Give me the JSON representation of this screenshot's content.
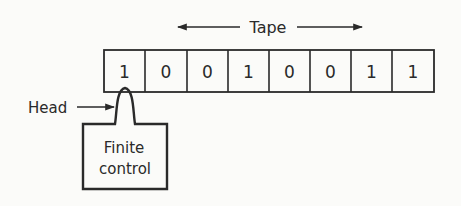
{
  "diagram": {
    "background": "#fbfbf9",
    "line_color": "#2a2a2a",
    "tape": {
      "label": "Tape",
      "direction": "bidirectional",
      "cells": [
        "1",
        "0",
        "0",
        "1",
        "0",
        "0",
        "1",
        "1"
      ]
    },
    "head": {
      "label": "Head",
      "position_index": 0
    },
    "finite_control": {
      "line1": "Finite",
      "line2": "control"
    }
  }
}
